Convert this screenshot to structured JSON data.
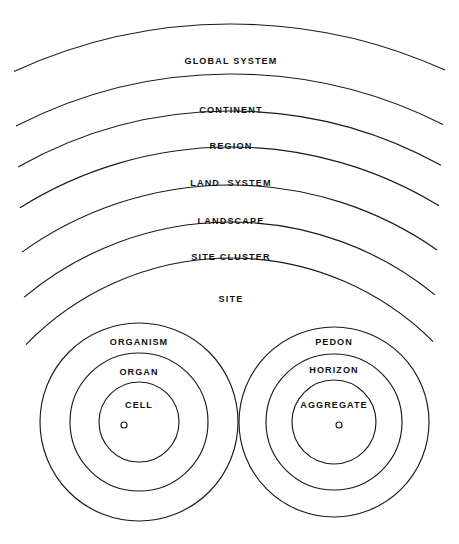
{
  "diagram": {
    "background_color": "#ffffff",
    "stroke_color": "#1a1a1a",
    "text_color": "#111111",
    "width": 459,
    "height": 544,
    "arc_levels": [
      {
        "id": "global-system",
        "label": "GLOBAL SYSTEM",
        "radius": 520,
        "label_x": 231,
        "label_y": 62
      },
      {
        "id": "continent",
        "label": "CONTINENT",
        "radius": 470,
        "label_x": 231,
        "label_y": 111
      },
      {
        "id": "region",
        "label": "REGION",
        "radius": 433,
        "label_x": 231,
        "label_y": 147
      },
      {
        "id": "land-system",
        "label": "LAND  SYSTEM",
        "radius": 397,
        "label_x": 231,
        "label_y": 184
      },
      {
        "id": "landscape",
        "label": "LANDSCAPE",
        "radius": 359,
        "label_x": 231,
        "label_y": 222
      },
      {
        "id": "site-cluster",
        "label": "SITE CLUSTER",
        "radius": 322,
        "label_x": 231,
        "label_y": 258
      },
      {
        "id": "site",
        "label": "SITE",
        "radius": 286,
        "label_x": 231,
        "label_y": 300
      }
    ],
    "arc_center": {
      "x": 231,
      "y": 544
    },
    "groups": [
      {
        "id": "biological",
        "center_x": 139,
        "center_y": 422,
        "rings": [
          {
            "id": "organism",
            "label": "ORGANISM",
            "radius": 99,
            "label_y": 343
          },
          {
            "id": "organ",
            "label": "ORGAN",
            "radius": 69,
            "label_y": 373
          },
          {
            "id": "cell",
            "label": "CELL",
            "radius": 40,
            "label_y": 406
          }
        ],
        "center_dot": {
          "radius": 3,
          "offset_x": -15,
          "offset_y": 3
        }
      },
      {
        "id": "pedological",
        "center_x": 334,
        "center_y": 422,
        "rings": [
          {
            "id": "pedon",
            "label": "PEDON",
            "radius": 95,
            "label_y": 343
          },
          {
            "id": "horizon",
            "label": "HORIZON",
            "radius": 68,
            "label_y": 371
          },
          {
            "id": "aggregate",
            "label": "AGGREGATE",
            "radius": 42,
            "label_y": 406
          }
        ],
        "center_dot": {
          "radius": 3,
          "offset_x": 5,
          "offset_y": 3
        }
      }
    ]
  }
}
